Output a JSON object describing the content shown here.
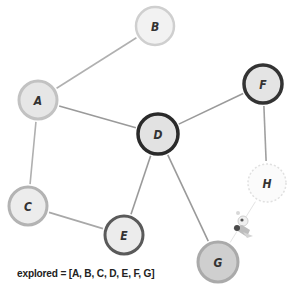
{
  "diagram": {
    "type": "graph-traversal",
    "nodes": [
      {
        "id": "A",
        "label": "A",
        "x": 38,
        "y": 100,
        "r": 19,
        "fill": "#e6e6e6",
        "stroke": "#c2c2c2",
        "stroke_width": 3,
        "dashed": false
      },
      {
        "id": "B",
        "label": "B",
        "x": 155,
        "y": 26,
        "r": 19,
        "fill": "#f2f2f2",
        "stroke": "#cfcfcf",
        "stroke_width": 2.5,
        "dashed": false
      },
      {
        "id": "C",
        "label": "C",
        "x": 28,
        "y": 206,
        "r": 19,
        "fill": "#ececec",
        "stroke": "#b3b3b3",
        "stroke_width": 3,
        "dashed": false
      },
      {
        "id": "D",
        "label": "D",
        "x": 158,
        "y": 134,
        "r": 20,
        "fill": "#e2e2e2",
        "stroke": "#2a2a2a",
        "stroke_width": 3.5,
        "dashed": false
      },
      {
        "id": "E",
        "label": "E",
        "x": 124,
        "y": 235,
        "r": 19,
        "fill": "#ececec",
        "stroke": "#5a5a5a",
        "stroke_width": 3,
        "dashed": false
      },
      {
        "id": "F",
        "label": "F",
        "x": 263,
        "y": 84,
        "r": 19,
        "fill": "#e4e4e4",
        "stroke": "#333333",
        "stroke_width": 3.5,
        "dashed": false
      },
      {
        "id": "G",
        "label": "G",
        "x": 218,
        "y": 262,
        "r": 20,
        "fill": "#cfcfcf",
        "stroke": "#aaaaaa",
        "stroke_width": 3,
        "dashed": false
      },
      {
        "id": "H",
        "label": "H",
        "x": 267,
        "y": 183,
        "r": 19,
        "fill": "#fbfbfb",
        "stroke": "#e0e0e0",
        "stroke_width": 1.5,
        "dashed": true
      }
    ],
    "edges": [
      {
        "from": "A",
        "to": "B",
        "color": "#b0b0b0"
      },
      {
        "from": "A",
        "to": "D",
        "color": "#9a9a9a"
      },
      {
        "from": "A",
        "to": "C",
        "color": "#b0b0b0"
      },
      {
        "from": "C",
        "to": "E",
        "color": "#a8a8a8"
      },
      {
        "from": "D",
        "to": "E",
        "color": "#9a9a9a"
      },
      {
        "from": "D",
        "to": "F",
        "color": "#9a9a9a"
      },
      {
        "from": "D",
        "to": "G",
        "color": "#9a9a9a"
      },
      {
        "from": "F",
        "to": "H",
        "color": "#a0a0a0"
      },
      {
        "from": "G",
        "to": "H",
        "color": "#e4e4e4",
        "faint": true
      }
    ],
    "explorer_icon": {
      "name": "rocket-explorer-icon",
      "x": 232,
      "y": 222
    },
    "caption": "explored = [A, B, C, D, E, F, G]"
  }
}
